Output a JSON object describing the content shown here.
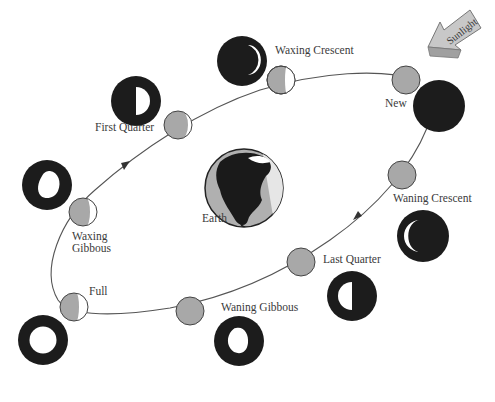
{
  "diagram": {
    "center_label": "Earth",
    "sun_label": "Sunlight",
    "colors": {
      "moon_lit_side": "#ffffff",
      "moon_shadow": "#a8a8a8",
      "view_disc": "#1c1c1c",
      "orbit": "#555555",
      "arrow_fill": "#bdbdbd"
    },
    "phases": [
      {
        "id": "new",
        "label": "New"
      },
      {
        "id": "waxing-crescent",
        "label": "Waxing Crescent"
      },
      {
        "id": "first-quarter",
        "label": "First Quarter"
      },
      {
        "id": "waxing-gibbous",
        "label_line1": "Waxing",
        "label_line2": "Gibbous"
      },
      {
        "id": "full",
        "label": "Full"
      },
      {
        "id": "waning-gibbous",
        "label": "Waning Gibbous"
      },
      {
        "id": "last-quarter",
        "label": "Last Quarter"
      },
      {
        "id": "waning-crescent",
        "label": "Waning Crescent"
      }
    ]
  }
}
